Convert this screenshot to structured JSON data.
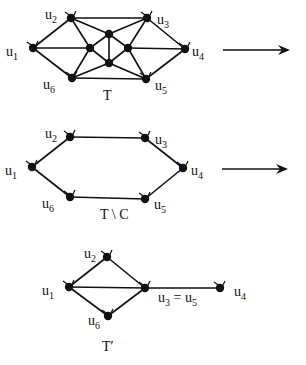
{
  "diagram": {
    "panels": [
      {
        "id": "T",
        "caption": "T",
        "caption_pos": [
          103,
          100
        ],
        "nodes": [
          {
            "id": "u1",
            "label": "u",
            "sub": "1",
            "x": 33,
            "y": 48,
            "lx": 6,
            "ly": 56
          },
          {
            "id": "u2",
            "label": "u",
            "sub": "2",
            "x": 71,
            "y": 18,
            "lx": 45,
            "ly": 19
          },
          {
            "id": "u3",
            "label": "u",
            "sub": "3",
            "x": 147,
            "y": 18,
            "lx": 157,
            "ly": 24
          },
          {
            "id": "u4",
            "label": "u",
            "sub": "4",
            "x": 185,
            "y": 49,
            "lx": 192,
            "ly": 56
          },
          {
            "id": "u5",
            "label": "u",
            "sub": "5",
            "x": 146,
            "y": 79,
            "lx": 155,
            "ly": 90
          },
          {
            "id": "u6",
            "label": "u",
            "sub": "6",
            "x": 72,
            "y": 78,
            "lx": 43,
            "ly": 89
          },
          {
            "id": "a",
            "label": "",
            "sub": "",
            "x": 109,
            "y": 34
          },
          {
            "id": "b",
            "label": "",
            "sub": "",
            "x": 90,
            "y": 48
          },
          {
            "id": "c",
            "label": "",
            "sub": "",
            "x": 128,
            "y": 48
          },
          {
            "id": "d",
            "label": "",
            "sub": "",
            "x": 109,
            "y": 63
          }
        ],
        "edges": [
          [
            "u1",
            "u2"
          ],
          [
            "u1",
            "u6"
          ],
          [
            "u1",
            "b"
          ],
          [
            "u2",
            "u3"
          ],
          [
            "u2",
            "b"
          ],
          [
            "u2",
            "a"
          ],
          [
            "u3",
            "a"
          ],
          [
            "u3",
            "c"
          ],
          [
            "u3",
            "u4"
          ],
          [
            "u4",
            "c"
          ],
          [
            "u4",
            "u5"
          ],
          [
            "u5",
            "c"
          ],
          [
            "u5",
            "d"
          ],
          [
            "u5",
            "u6"
          ],
          [
            "u6",
            "b"
          ],
          [
            "u6",
            "d"
          ],
          [
            "a",
            "b"
          ],
          [
            "a",
            "c"
          ],
          [
            "a",
            "d"
          ],
          [
            "b",
            "d"
          ],
          [
            "c",
            "d"
          ]
        ]
      },
      {
        "id": "T-minus-C",
        "caption": "T \\ C",
        "caption_pos": [
          100,
          219
        ],
        "nodes": [
          {
            "id": "u1",
            "label": "u",
            "sub": "1",
            "x": 32,
            "y": 167,
            "lx": 5,
            "ly": 175
          },
          {
            "id": "u2",
            "label": "u",
            "sub": "2",
            "x": 70,
            "y": 137,
            "lx": 45,
            "ly": 138
          },
          {
            "id": "u3",
            "label": "u",
            "sub": "3",
            "x": 145,
            "y": 138,
            "lx": 155,
            "ly": 144
          },
          {
            "id": "u4",
            "label": "u",
            "sub": "4",
            "x": 183,
            "y": 168,
            "lx": 191,
            "ly": 175
          },
          {
            "id": "u5",
            "label": "u",
            "sub": "5",
            "x": 145,
            "y": 199,
            "lx": 154,
            "ly": 209
          },
          {
            "id": "u6",
            "label": "u",
            "sub": "6",
            "x": 70,
            "y": 197,
            "lx": 42,
            "ly": 208
          }
        ],
        "edges": [
          [
            "u1",
            "u2"
          ],
          [
            "u2",
            "u3"
          ],
          [
            "u3",
            "u4"
          ],
          [
            "u4",
            "u5"
          ],
          [
            "u5",
            "u6"
          ],
          [
            "u6",
            "u1"
          ]
        ]
      },
      {
        "id": "T-prime",
        "caption": "T′",
        "caption_pos": [
          102,
          351
        ],
        "nodes": [
          {
            "id": "u1",
            "label": "u",
            "sub": "1",
            "x": 69,
            "y": 287,
            "lx": 42,
            "ly": 295
          },
          {
            "id": "u2",
            "label": "u",
            "sub": "2",
            "x": 107,
            "y": 257,
            "lx": 84,
            "ly": 258
          },
          {
            "id": "u35",
            "label": "u",
            "sub": "3",
            "x": 145,
            "y": 288,
            "lx": 158,
            "ly": 302,
            "extra": " = u",
            "extra_sub": "5"
          },
          {
            "id": "u4",
            "label": "u",
            "sub": "4",
            "x": 220,
            "y": 288,
            "lx": 234,
            "ly": 296
          },
          {
            "id": "u6",
            "label": "u",
            "sub": "6",
            "x": 108,
            "y": 316,
            "lx": 88,
            "ly": 325
          }
        ],
        "edges": [
          [
            "u1",
            "u2"
          ],
          [
            "u1",
            "u35"
          ],
          [
            "u1",
            "u6"
          ],
          [
            "u2",
            "u35"
          ],
          [
            "u6",
            "u35"
          ],
          [
            "u35",
            "u4"
          ]
        ]
      }
    ],
    "arrows": [
      {
        "x1": 223,
        "y1": 50,
        "x2": 290,
        "y2": 50
      },
      {
        "x1": 222,
        "y1": 169,
        "x2": 288,
        "y2": 169
      }
    ]
  }
}
